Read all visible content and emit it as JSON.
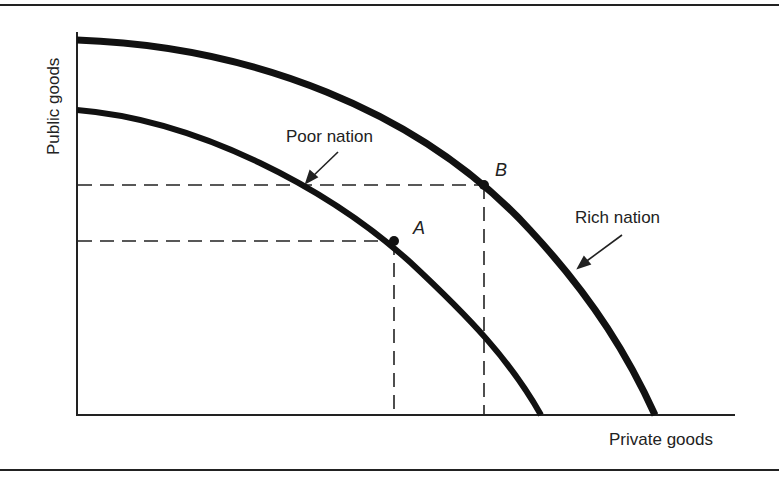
{
  "diagram": {
    "type": "production-possibilities-frontier",
    "axes": {
      "x_label": "Private goods",
      "y_label": "Public goods"
    },
    "curves": [
      {
        "name": "Poor nation",
        "label": "Poor nation",
        "stroke": "#111111"
      },
      {
        "name": "Rich nation",
        "label": "Rich nation",
        "stroke": "#111111"
      }
    ],
    "points": [
      {
        "label": "A",
        "on_curve": "Poor nation"
      },
      {
        "label": "B",
        "on_curve": "Rich nation"
      }
    ]
  }
}
